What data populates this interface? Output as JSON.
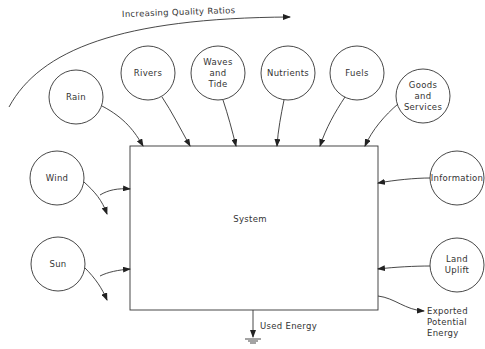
{
  "diagram": {
    "quality_arrow_label": "Increasing Quality Ratios",
    "system_label": "System",
    "used_energy_label": "Used Energy",
    "exported_label": "Exported\nPotential\nEnergy",
    "sources": [
      {
        "id": "rain",
        "label": "Rain"
      },
      {
        "id": "rivers",
        "label": "Rivers"
      },
      {
        "id": "waves",
        "label": "Waves\nand\nTide"
      },
      {
        "id": "nutrients",
        "label": "Nutrients"
      },
      {
        "id": "fuels",
        "label": "Fuels"
      },
      {
        "id": "goods",
        "label": "Goods\nand\nServices"
      },
      {
        "id": "wind",
        "label": "Wind"
      },
      {
        "id": "sun",
        "label": "Sun"
      },
      {
        "id": "information",
        "label": "Information"
      },
      {
        "id": "uplift",
        "label": "Land\nUplift"
      }
    ],
    "colors": {
      "stroke": "#333333",
      "background": "#ffffff"
    }
  }
}
